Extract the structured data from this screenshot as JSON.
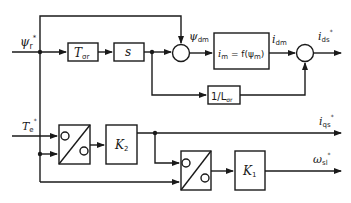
{
  "diagram": {
    "type": "control-block-diagram",
    "inputs": {
      "flux_ref": {
        "symbol": "ψ",
        "sub": "r",
        "sup": "*"
      },
      "torque_ref": {
        "symbol": "T",
        "sub": "e",
        "sup": "*"
      }
    },
    "blocks": {
      "t_sigma": {
        "symbol": "T",
        "sub": "σr"
      },
      "s": {
        "label": "s"
      },
      "magnetizing": {
        "lhs": "i",
        "lhs_sub": "m",
        "eq": " = f(ψ",
        "rhs_sub": "m",
        "close": ")"
      },
      "inv_l": {
        "prefix": "1/L",
        "sub": "σr"
      },
      "k2": {
        "symbol": "K",
        "sub": "2"
      },
      "k1": {
        "symbol": "K",
        "sub": "1"
      }
    },
    "signals": {
      "psi_dm": {
        "symbol": "ψ",
        "sub": "dm"
      },
      "i_dm": {
        "symbol": "i",
        "sub": "dm"
      }
    },
    "outputs": {
      "i_ds": {
        "symbol": "i",
        "sub": "ds",
        "sup": "*"
      },
      "i_qs": {
        "symbol": "i",
        "sub": "qs",
        "sup": "*"
      },
      "omega_sl": {
        "symbol": "ω",
        "sub": "sl",
        "sup": "*"
      }
    },
    "colors": {
      "line": "#1a1a1a",
      "background": "#ffffff"
    }
  }
}
